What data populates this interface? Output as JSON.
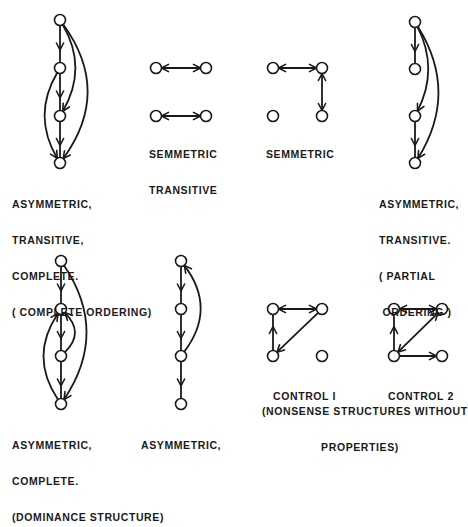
{
  "colors": {
    "ink": "#1a1a1a",
    "background": "#ffffff"
  },
  "node_radius": 5.5,
  "diagrams": [
    {
      "id": "complete-ordering",
      "label_lines": [
        "ASYMMETRIC,",
        "TRANSITIVE,",
        "COMPLETE.",
        "( COMPLETE ORDERING)"
      ],
      "label_pos": [
        12,
        174
      ],
      "label_align": "left",
      "nodes": [
        [
          60,
          20
        ],
        [
          60,
          68
        ],
        [
          60,
          116
        ],
        [
          60,
          163
        ]
      ],
      "edges": [
        {
          "from": 0,
          "to": 1,
          "type": "line"
        },
        {
          "from": 1,
          "to": 2,
          "type": "line"
        },
        {
          "from": 2,
          "to": 3,
          "type": "line"
        },
        {
          "from": 0,
          "to": 2,
          "type": "curve",
          "bend": -14
        },
        {
          "from": 0,
          "to": 3,
          "type": "curve",
          "bend": -26
        },
        {
          "from": 1,
          "to": 3,
          "type": "curve",
          "bend": 14
        }
      ]
    },
    {
      "id": "symmetric-transitive",
      "label_lines": [
        "SEMMETRIC",
        "TRANSITIVE"
      ],
      "label_pos": [
        149,
        124
      ],
      "label_align": "left",
      "nodes": [
        [
          156,
          68
        ],
        [
          206,
          68
        ],
        [
          156,
          116
        ],
        [
          206,
          116
        ]
      ],
      "edges": [
        {
          "from": 0,
          "to": 1,
          "type": "bidir"
        },
        {
          "from": 2,
          "to": 3,
          "type": "bidir"
        }
      ]
    },
    {
      "id": "symmetric",
      "label_lines": [
        "SEMMETRIC"
      ],
      "label_pos": [
        266,
        124
      ],
      "label_align": "left",
      "nodes": [
        [
          273,
          68
        ],
        [
          322,
          68
        ],
        [
          273,
          116
        ],
        [
          322,
          116
        ]
      ],
      "edges": [
        {
          "from": 0,
          "to": 1,
          "type": "bidir"
        },
        {
          "from": 1,
          "to": 3,
          "type": "bidir"
        }
      ]
    },
    {
      "id": "partial-ordering",
      "label_lines": [
        "ASYMMETRIC,",
        "TRANSITIVE.",
        "( PARTIAL",
        " ORDERING )"
      ],
      "label_pos": [
        379,
        174
      ],
      "label_align": "left",
      "nodes": [
        [
          415,
          22
        ],
        [
          415,
          69
        ],
        [
          415,
          116
        ],
        [
          415,
          163
        ]
      ],
      "edges": [
        {
          "from": 0,
          "to": 1,
          "type": "line"
        },
        {
          "from": 2,
          "to": 3,
          "type": "line"
        },
        {
          "from": 0,
          "to": 2,
          "type": "curve",
          "bend": -12
        },
        {
          "from": 0,
          "to": 3,
          "type": "curve",
          "bend": -22
        }
      ]
    },
    {
      "id": "dominance-structure",
      "label_lines": [
        "ASYMMETRIC,",
        "COMPLETE.",
        "(DOMINANCE STRUCTURE)"
      ],
      "label_pos": [
        12,
        415
      ],
      "label_align": "left",
      "nodes": [
        [
          61,
          261
        ],
        [
          61,
          309
        ],
        [
          61,
          356
        ],
        [
          61,
          404
        ]
      ],
      "edges": [
        {
          "from": 0,
          "to": 1,
          "type": "line"
        },
        {
          "from": 1,
          "to": 2,
          "type": "line"
        },
        {
          "from": 2,
          "to": 3,
          "type": "line"
        },
        {
          "from": 0,
          "to": 3,
          "type": "curve",
          "bend": -24
        },
        {
          "from": 2,
          "to": 1,
          "type": "curve",
          "bend": 12
        },
        {
          "from": 3,
          "to": 1,
          "type": "curve",
          "bend": -16
        }
      ]
    },
    {
      "id": "asymmetric",
      "label_lines": [
        "ASYMMETRIC,"
      ],
      "label_pos": [
        141,
        415
      ],
      "label_align": "left",
      "nodes": [
        [
          181,
          261
        ],
        [
          181,
          309
        ],
        [
          181,
          356
        ],
        [
          181,
          404
        ]
      ],
      "edges": [
        {
          "from": 0,
          "to": 1,
          "type": "line"
        },
        {
          "from": 1,
          "to": 2,
          "type": "line"
        },
        {
          "from": 2,
          "to": 3,
          "type": "line"
        },
        {
          "from": 2,
          "to": 0,
          "type": "curve",
          "bend": 18
        }
      ]
    },
    {
      "id": "control-1",
      "label_lines": [
        "CONTROL I"
      ],
      "label_pos": [
        273,
        366
      ],
      "label_align": "left",
      "nodes": [
        [
          273,
          309
        ],
        [
          322,
          309
        ],
        [
          273,
          356
        ],
        [
          322,
          356
        ]
      ],
      "edges": [
        {
          "from": 0,
          "to": 1,
          "type": "bidir"
        },
        {
          "from": 1,
          "to": 2,
          "type": "line"
        },
        {
          "from": 2,
          "to": 0,
          "type": "line"
        }
      ]
    },
    {
      "id": "control-2",
      "label_lines": [
        "CONTROL 2"
      ],
      "label_pos": [
        388,
        366
      ],
      "label_align": "left",
      "nodes": [
        [
          394,
          309
        ],
        [
          442,
          309
        ],
        [
          394,
          356
        ],
        [
          442,
          356
        ]
      ],
      "edges": [
        {
          "from": 0,
          "to": 1,
          "type": "bidir"
        },
        {
          "from": 1,
          "to": 2,
          "type": "bidir"
        },
        {
          "from": 2,
          "to": 0,
          "type": "line"
        },
        {
          "from": 2,
          "to": 3,
          "type": "line"
        }
      ]
    }
  ],
  "footer_caption": {
    "lines": [
      "(NONSENSE STRUCTURES WITHOUT",
      "PROPERTIES)"
    ],
    "pos": [
      262,
      381
    ]
  }
}
